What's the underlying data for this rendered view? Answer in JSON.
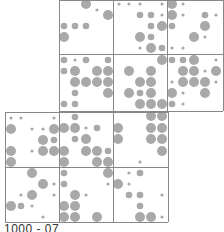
{
  "chart_data": {
    "type": "scatter",
    "title": "",
    "subtitle": "",
    "xlabel": "",
    "ylabel": "",
    "grid": true,
    "legend": null,
    "colors": {
      "dot": "#a9a9a9",
      "grid": "#888888",
      "text": "#333333"
    },
    "radii": {
      "s": 1.6,
      "m": 3.3,
      "l": 5.0
    },
    "blocks": [
      {
        "name": "top-block",
        "x": 59,
        "y": 0,
        "cols": [
          59,
          113,
          167,
          223
        ],
        "rows": [
          0,
          54,
          111
        ]
      },
      {
        "name": "lower-block",
        "x": 5,
        "y": 112,
        "cols": [
          5,
          59,
          113,
          168
        ],
        "rows": [
          112,
          167,
          222
        ]
      }
    ],
    "dots": [
      [
        86,
        4,
        "l"
      ],
      [
        97,
        10,
        "s"
      ],
      [
        108,
        15,
        "l"
      ],
      [
        64,
        26,
        "m"
      ],
      [
        75,
        26,
        "m"
      ],
      [
        86,
        26,
        "m"
      ],
      [
        64,
        37,
        "l"
      ],
      [
        119,
        4,
        "s"
      ],
      [
        129,
        4,
        "s"
      ],
      [
        140,
        4,
        "s"
      ],
      [
        162,
        4,
        "s"
      ],
      [
        140,
        15,
        "m"
      ],
      [
        151,
        15,
        "m"
      ],
      [
        162,
        15,
        "s"
      ],
      [
        151,
        26,
        "m"
      ],
      [
        162,
        26,
        "l"
      ],
      [
        140,
        37,
        "l"
      ],
      [
        151,
        37,
        "m"
      ],
      [
        140,
        48,
        "s"
      ],
      [
        151,
        48,
        "l"
      ],
      [
        162,
        48,
        "m"
      ],
      [
        172,
        4,
        "l"
      ],
      [
        183,
        4,
        "s"
      ],
      [
        172,
        15,
        "l"
      ],
      [
        183,
        15,
        "s"
      ],
      [
        205,
        15,
        "m"
      ],
      [
        216,
        15,
        "s"
      ],
      [
        172,
        26,
        "m"
      ],
      [
        205,
        26,
        "l"
      ],
      [
        194,
        37,
        "l"
      ],
      [
        205,
        37,
        "s"
      ],
      [
        172,
        48,
        "s"
      ],
      [
        183,
        48,
        "s"
      ],
      [
        64,
        60,
        "m"
      ],
      [
        75,
        60,
        "s"
      ],
      [
        86,
        60,
        "m"
      ],
      [
        108,
        60,
        "m"
      ],
      [
        64,
        71,
        "m"
      ],
      [
        75,
        71,
        "l"
      ],
      [
        97,
        71,
        "l"
      ],
      [
        108,
        71,
        "l"
      ],
      [
        75,
        82,
        "l"
      ],
      [
        86,
        82,
        "l"
      ],
      [
        97,
        82,
        "l"
      ],
      [
        108,
        82,
        "l"
      ],
      [
        75,
        93,
        "m"
      ],
      [
        108,
        93,
        "l"
      ],
      [
        64,
        104,
        "m"
      ],
      [
        75,
        104,
        "m"
      ],
      [
        162,
        60,
        "l"
      ],
      [
        129,
        71,
        "l"
      ],
      [
        151,
        71,
        "l"
      ],
      [
        140,
        82,
        "l"
      ],
      [
        151,
        82,
        "l"
      ],
      [
        129,
        93,
        "l"
      ],
      [
        140,
        93,
        "m"
      ],
      [
        151,
        93,
        "l"
      ],
      [
        140,
        104,
        "l"
      ],
      [
        151,
        104,
        "l"
      ],
      [
        162,
        104,
        "l"
      ],
      [
        172,
        60,
        "m"
      ],
      [
        183,
        60,
        "m"
      ],
      [
        194,
        60,
        "l"
      ],
      [
        216,
        60,
        "s"
      ],
      [
        183,
        71,
        "l"
      ],
      [
        194,
        71,
        "l"
      ],
      [
        205,
        71,
        "s"
      ],
      [
        216,
        71,
        "l"
      ],
      [
        172,
        82,
        "s"
      ],
      [
        183,
        82,
        "l"
      ],
      [
        194,
        82,
        "l"
      ],
      [
        205,
        82,
        "l"
      ],
      [
        216,
        82,
        "s"
      ],
      [
        172,
        93,
        "l"
      ],
      [
        183,
        93,
        "s"
      ],
      [
        205,
        93,
        "l"
      ],
      [
        172,
        104,
        "m"
      ],
      [
        183,
        104,
        "s"
      ],
      [
        11,
        118,
        "s"
      ],
      [
        21,
        118,
        "s"
      ],
      [
        54,
        118,
        "s"
      ],
      [
        11,
        129,
        "l"
      ],
      [
        32,
        129,
        "s"
      ],
      [
        43,
        129,
        "s"
      ],
      [
        54,
        129,
        "l"
      ],
      [
        43,
        140,
        "l"
      ],
      [
        54,
        140,
        "m"
      ],
      [
        11,
        151,
        "l"
      ],
      [
        32,
        151,
        "s"
      ],
      [
        43,
        151,
        "l"
      ],
      [
        54,
        151,
        "l"
      ],
      [
        11,
        162,
        "l"
      ],
      [
        75,
        117,
        "m"
      ],
      [
        64,
        128,
        "l"
      ],
      [
        75,
        128,
        "l"
      ],
      [
        86,
        128,
        "s"
      ],
      [
        97,
        128,
        "m"
      ],
      [
        75,
        139,
        "m"
      ],
      [
        86,
        139,
        "l"
      ],
      [
        64,
        151,
        "l"
      ],
      [
        86,
        151,
        "l"
      ],
      [
        97,
        151,
        "l"
      ],
      [
        108,
        151,
        "m"
      ],
      [
        64,
        162,
        "l"
      ],
      [
        97,
        162,
        "l"
      ],
      [
        108,
        162,
        "l"
      ],
      [
        151,
        116,
        "l"
      ],
      [
        162,
        116,
        "l"
      ],
      [
        118,
        128,
        "l"
      ],
      [
        151,
        128,
        "l"
      ],
      [
        162,
        128,
        "l"
      ],
      [
        118,
        139,
        "l"
      ],
      [
        151,
        139,
        "l"
      ],
      [
        162,
        139,
        "l"
      ],
      [
        162,
        151,
        "l"
      ],
      [
        140,
        162,
        "s"
      ],
      [
        32,
        173,
        "l"
      ],
      [
        43,
        184,
        "l"
      ],
      [
        54,
        184,
        "s"
      ],
      [
        21,
        195,
        "s"
      ],
      [
        32,
        195,
        "l"
      ],
      [
        54,
        195,
        "s"
      ],
      [
        11,
        206,
        "l"
      ],
      [
        21,
        206,
        "m"
      ],
      [
        32,
        206,
        "s"
      ],
      [
        43,
        217,
        "s"
      ],
      [
        64,
        173,
        "m"
      ],
      [
        108,
        173,
        "l"
      ],
      [
        64,
        184,
        "m"
      ],
      [
        108,
        184,
        "s"
      ],
      [
        75,
        195,
        "l"
      ],
      [
        86,
        195,
        "s"
      ],
      [
        64,
        206,
        "l"
      ],
      [
        75,
        206,
        "l"
      ],
      [
        64,
        217,
        "l"
      ],
      [
        75,
        217,
        "l"
      ],
      [
        97,
        217,
        "l"
      ],
      [
        129,
        173,
        "s"
      ],
      [
        140,
        173,
        "m"
      ],
      [
        118,
        184,
        "l"
      ],
      [
        129,
        184,
        "s"
      ],
      [
        129,
        195,
        "m"
      ],
      [
        140,
        195,
        "m"
      ],
      [
        162,
        195,
        "s"
      ],
      [
        140,
        206,
        "m"
      ],
      [
        140,
        217,
        "l"
      ],
      [
        151,
        217,
        "l"
      ],
      [
        162,
        217,
        "s"
      ]
    ],
    "annotations": [
      "1000 - 07"
    ]
  },
  "caption": "1000 - 07"
}
